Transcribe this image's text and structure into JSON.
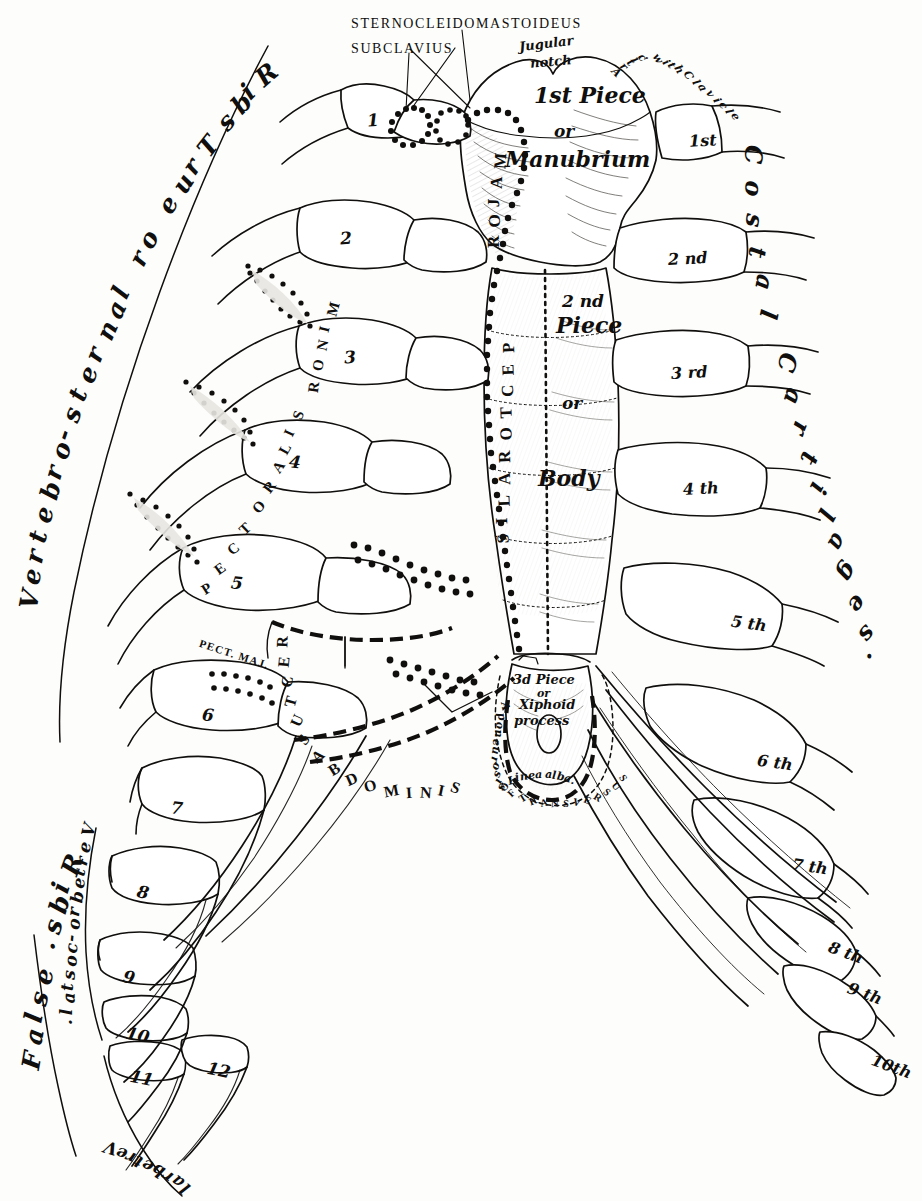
{
  "figure": {
    "background": "#fdfdfc",
    "ink": "#100f0d",
    "shade": "#e8e6e1"
  },
  "callout_labels": [
    {
      "id": "sternocleidomastoideus",
      "text": "STERNOCLEIDOMASTOIDEUS"
    },
    {
      "id": "subclavius",
      "text": "SUBCLAVIUS"
    }
  ],
  "sternum_labels": {
    "jugular_notch": "Jugular",
    "jugular_notch2": "notch",
    "artic_clavicle": "Artic. with Clavicle",
    "first_piece": "1st Piece",
    "or_1": "or",
    "manubrium": "Manubrium",
    "second_piece_num": "2 nd",
    "second_piece_word": "Piece",
    "or_2": "or",
    "body": "Body",
    "third_piece": "3d Piece",
    "or_3": "or",
    "xiphoid_1": "Xiphoid",
    "xiphoid_2": "process",
    "linea_alba": "Linea alba.",
    "aponeurosis": "Aponeurosis",
    "of_transversus": "OF TRANSVERSUS"
  },
  "muscle_labels": {
    "pectoralis_major": "PECTORALIS MAJOR",
    "pectoralis_minor": "PECTORALIS MINOR",
    "rectus_abdominis": "RECTUS ABDOMINIS",
    "pect_maj_small": "PECT. MAJ."
  },
  "bracket_labels": {
    "vertebro_sternal": "Vertebro-sternal or True Ribs",
    "costal_cartilages": "Costal Cartilages.",
    "false_ribs": "False Ribs.",
    "vertebro_costal": "Vertebro-costal.",
    "vertebral": "Vertebral"
  },
  "rib_numbers": [
    {
      "n": "1",
      "x": 367,
      "y": 110
    },
    {
      "n": "2",
      "x": 340,
      "y": 228
    },
    {
      "n": "3",
      "x": 344,
      "y": 347
    },
    {
      "n": "4",
      "x": 289,
      "y": 452
    },
    {
      "n": "5",
      "x": 231,
      "y": 573
    },
    {
      "n": "6",
      "x": 202,
      "y": 705
    },
    {
      "n": "7",
      "x": 171,
      "y": 798
    },
    {
      "n": "8",
      "x": 137,
      "y": 882
    },
    {
      "n": "9",
      "x": 123,
      "y": 967
    },
    {
      "n": "10",
      "x": 126,
      "y": 1025
    },
    {
      "n": "11",
      "x": 130,
      "y": 1068
    },
    {
      "n": "12",
      "x": 207,
      "y": 1060
    }
  ],
  "cartilage_numbers": [
    {
      "label": "1st",
      "x": 689,
      "y": 131
    },
    {
      "label": "2 nd",
      "x": 668,
      "y": 249
    },
    {
      "label": "3 rd",
      "x": 671,
      "y": 363
    },
    {
      "label": "4 th",
      "x": 683,
      "y": 479
    },
    {
      "label": "5 th",
      "x": 731,
      "y": 614
    },
    {
      "label": "6 th",
      "x": 757,
      "y": 753
    },
    {
      "label": "7 th",
      "x": 792,
      "y": 857
    },
    {
      "label": "8 th",
      "x": 828,
      "y": 943
    },
    {
      "label": "9 th",
      "x": 847,
      "y": 984
    },
    {
      "label": "10th",
      "x": 871,
      "y": 1057
    }
  ],
  "arc_text": {
    "vertebro_sternal_chars": "Vertebro-sternal or True Ribs",
    "costal_cartilages_chars": "Costal Cartilages.",
    "pectoralis_major_chars": "PECTORALIS MAJOR",
    "pectoralis_minor_chars": "PECTORALIS MINOR",
    "rectus_abdominis_chars": "RECTUS ABDOMINIS",
    "false_ribs_chars": "False Ribs.",
    "vertebro_costal_chars": "Vertebro-costal.",
    "vertebral_chars": "Vertebral",
    "aponeurosis_chars": "Aponeurosis",
    "of_transversus_chars": "OF TRANSVERSUS",
    "linea_alba_chars": "Linea alba."
  }
}
